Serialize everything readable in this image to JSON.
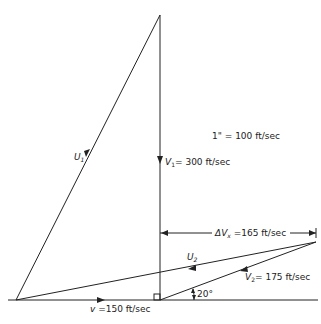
{
  "diagram": {
    "type": "velocity-vector-diagram",
    "scale_label": "1\" = 100 ft/sec",
    "vectors": {
      "U1": {
        "symbol": "U",
        "sub": "1",
        "label": ""
      },
      "V1": {
        "symbol": "V",
        "sub": "1",
        "label": "= 300 ft/sec"
      },
      "U2": {
        "symbol": "U",
        "sub": "2",
        "label": ""
      },
      "V2": {
        "symbol": "V",
        "sub": "2",
        "label": "= 175 ft/sec"
      },
      "v": {
        "symbol": "v",
        "label": " =150 ft/sec"
      },
      "dVx": {
        "symbol": "ΔV",
        "sub": "x",
        "label": " =165 ft/sec"
      }
    },
    "angle_label": "20°",
    "colors": {
      "line": "#222222",
      "background": "#ffffff"
    }
  }
}
